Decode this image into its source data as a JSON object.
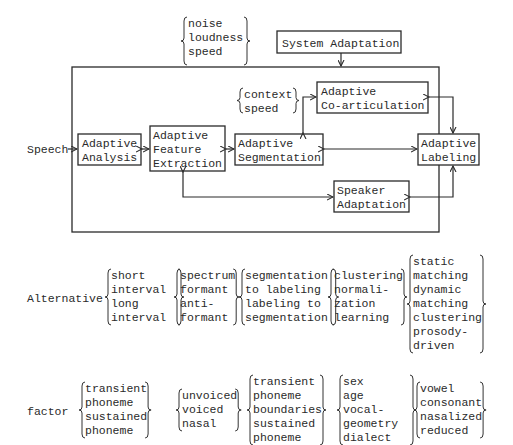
{
  "diagram": {
    "input_label": "Speech",
    "top_conditions": [
      "noise",
      "loudness",
      "speed"
    ],
    "system_adaptation": [
      "System Adaptation"
    ],
    "coart_conditions": [
      "context",
      "speed"
    ],
    "boxes": {
      "analysis": [
        "Adaptive",
        "Analysis"
      ],
      "feature": [
        "Adaptive",
        "Feature",
        "Extraction"
      ],
      "segmentation": [
        "Adaptive",
        "Segmentation"
      ],
      "coarticulation": [
        "Adaptive",
        "Co-articulation"
      ],
      "labeling": [
        "Adaptive",
        "Labeling"
      ],
      "speaker": [
        "Speaker",
        "Adaptation"
      ]
    }
  },
  "alternative": {
    "label": "Alternative",
    "groups": [
      [
        "short",
        "  interval",
        "long",
        "  interval"
      ],
      [
        "spectrum",
        "formant",
        "anti-",
        " formant"
      ],
      [
        "segmentation",
        " to labeling",
        "labeling to",
        " segmentation"
      ],
      [
        "clustering",
        "normali-",
        " zation",
        "learning"
      ],
      [
        "static",
        " matching",
        "dynamic",
        " matching",
        "clustering",
        "prosody-",
        " driven"
      ]
    ]
  },
  "factor": {
    "label": "factor",
    "groups": [
      [
        "transient",
        " phoneme",
        "sustained",
        " phoneme"
      ],
      [
        "unvoiced",
        "voiced",
        "nasal"
      ],
      [
        "transient",
        " phoneme",
        "boundaries",
        " sustained",
        "  phoneme"
      ],
      [
        "sex",
        "age",
        "vocal-",
        "  geometry",
        "dialect"
      ],
      [
        "vowel",
        "consonant",
        "nasalized",
        "reduced"
      ]
    ]
  }
}
